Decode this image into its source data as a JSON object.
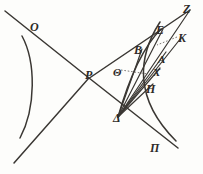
{
  "figure": {
    "domain": "diagram",
    "width": 203,
    "height": 174,
    "ink_color": "#3a3733",
    "background_color": "#fdfdfb",
    "leader_color": "#5a5550"
  },
  "labels": [
    {
      "id": "O",
      "text": "O",
      "x": 30,
      "y": 21,
      "size": "big"
    },
    {
      "id": "P",
      "text": "P",
      "x": 85,
      "y": 69,
      "size": "big"
    },
    {
      "id": "Theta",
      "text": "Θ",
      "x": 113,
      "y": 67,
      "size": "normal"
    },
    {
      "id": "Pi",
      "text": "Π",
      "x": 150,
      "y": 142,
      "size": "big"
    },
    {
      "id": "Delta",
      "text": "Δ",
      "x": 113,
      "y": 112,
      "size": "big"
    },
    {
      "id": "Z",
      "text": "Z",
      "x": 183,
      "y": 3,
      "size": "big"
    },
    {
      "id": "E",
      "text": "E",
      "x": 156,
      "y": 24,
      "size": "big"
    },
    {
      "id": "K",
      "text": "K",
      "x": 178,
      "y": 32,
      "size": "big"
    },
    {
      "id": "B",
      "text": "B",
      "x": 134,
      "y": 44,
      "size": "big"
    },
    {
      "id": "A",
      "text": "A",
      "x": 158,
      "y": 54,
      "size": "normal"
    },
    {
      "id": "X",
      "text": "X",
      "x": 153,
      "y": 67,
      "size": "normal"
    },
    {
      "id": "H",
      "text": "H",
      "x": 146,
      "y": 83,
      "size": "big"
    }
  ],
  "lines": [
    {
      "id": "line-O-Pi",
      "name": "descending-line-through-P",
      "points": "5,11 89,78 178,148",
      "style": "axis-line"
    },
    {
      "id": "line-ascending-to-Z",
      "name": "ascending-line-through-P",
      "points": "14,163 88,79 190,10",
      "style": "axis-line"
    }
  ],
  "rays_from_delta": [
    {
      "id": "ray-delta-Z",
      "name": "ray-delta-to-Z",
      "points": "118,117 190,10"
    },
    {
      "id": "ray-delta-E",
      "name": "ray-delta-to-E",
      "points": "118,117 163,29"
    },
    {
      "id": "ray-delta-K",
      "name": "ray-delta-to-K",
      "points": "118,117 181,38"
    },
    {
      "id": "ray-delta-A",
      "name": "ray-delta-to-A",
      "points": "118,117 166,52"
    },
    {
      "id": "ray-delta-X",
      "name": "ray-delta-to-X",
      "points": "118,117 160,68"
    },
    {
      "id": "ray-delta-H",
      "name": "ray-delta-to-H",
      "points": "118,117 153,84"
    },
    {
      "id": "ray-delta-B",
      "name": "ray-delta-to-B",
      "points": "118,117 142,49"
    }
  ],
  "conics": [
    {
      "id": "left-branch",
      "name": "hyperbola-left-branch",
      "path": "M 22,36 C 36,62 36,108 20,138"
    },
    {
      "id": "right-branch",
      "name": "hyperbola-right-branch",
      "path": "M 160,22 C 138,56 133,98 176,141"
    },
    {
      "id": "inner-arc",
      "name": "inner-arc-B-to-delta",
      "path": "M 161,29 C 142,48 128,82 118,117"
    }
  ],
  "leaders": [
    {
      "id": "leader-theta",
      "name": "leader-from-theta-to-curve",
      "points": "121,70 148,74"
    },
    {
      "id": "leader-K",
      "name": "leader-from-K-to-curve",
      "points": "177,37 157,45"
    }
  ]
}
